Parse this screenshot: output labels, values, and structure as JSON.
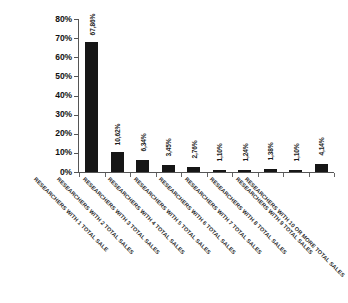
{
  "chart_data": {
    "type": "bar",
    "title": "",
    "subtitle": "",
    "xlabel": "",
    "ylabel": "",
    "ylim": [
      0,
      80
    ],
    "grid": false,
    "legend": "none",
    "orientation": "vertical",
    "bar_color": "#161616",
    "axis_color": "#555555",
    "background": "#ffffff",
    "value_label_format": "comma-decimal-percent",
    "categories": [
      "RESEARCHERS WITH 1 TOTAL SALE",
      "RESEARCHERS WITH 2 TOTAL SALES",
      "RESEARCHERS WITH 3 TOTAL SALES",
      "RESEARCHERS WITH 4 TOTAL SALES",
      "RESEARCHERS WITH 5 TOTAL SALES",
      "RESEARCHERS WITH 6 TOTAL SALES",
      "RESEARCHERS WITH 7 TOTAL SALES",
      "RESEARCHERS WITH 8 TOTAL SALES",
      "RESEARCHERS WITH 9 TOTAL SALES",
      "RESEARCHERS WITH 10 OR MORE TOTAL SALES"
    ],
    "values": [
      67.86,
      10.62,
      6.34,
      3.45,
      2.76,
      1.1,
      1.24,
      1.38,
      1.1,
      4.14
    ],
    "value_labels": [
      "67,86%",
      "10,62%",
      "6,34%",
      "3,45%",
      "2,76%",
      "1,10%",
      "1,24%",
      "1,38%",
      "1,10%",
      "4,14%"
    ],
    "y_ticks": [
      0,
      10,
      20,
      30,
      40,
      50,
      60,
      70,
      80
    ],
    "y_tick_labels": [
      "0%",
      "10%",
      "20%",
      "30%",
      "40%",
      "50%",
      "60%",
      "70%",
      "80%"
    ]
  }
}
